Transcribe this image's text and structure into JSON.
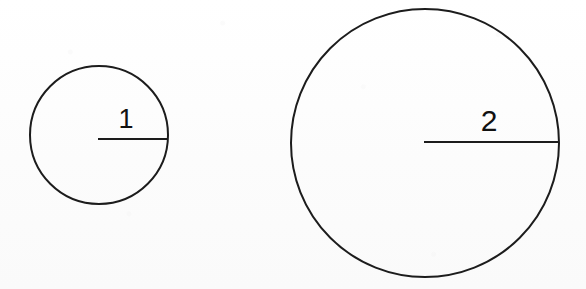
{
  "figure": {
    "title": "Two circles with labeled radii",
    "background_color": "#fdfdfd",
    "stroke_color": "#1c1c1c",
    "label_color": "#111111"
  },
  "chart_data": {
    "type": "diagram",
    "title": "Two circles with labeled radii",
    "subtitle": "",
    "xlabel": "",
    "ylabel": "",
    "grid": false,
    "legend": null,
    "units": "",
    "shapes": [
      {
        "name": "small-circle",
        "kind": "circle",
        "center_x": 99,
        "center_y": 135,
        "radius": 69,
        "radius_label": "1",
        "radius_value": 1,
        "label_x": 126,
        "label_y": 128,
        "radius_line": {
          "x1": 98,
          "y1": 139,
          "x2": 168,
          "y2": 139
        },
        "stroke_width": 2,
        "label_font_size": 27
      },
      {
        "name": "large-circle",
        "kind": "circle",
        "center_x": 425,
        "center_y": 143,
        "radius": 134,
        "radius_label": "2",
        "radius_value": 2,
        "label_x": 489,
        "label_y": 131,
        "radius_line": {
          "x1": 424,
          "y1": 142,
          "x2": 559,
          "y2": 142
        },
        "stroke_width": 2,
        "label_font_size": 30
      }
    ],
    "annotations": [
      {
        "text": "1",
        "x": 126,
        "y": 118,
        "describes": "radius of small circle"
      },
      {
        "text": "2",
        "x": 489,
        "y": 120,
        "describes": "radius of large circle"
      }
    ]
  }
}
